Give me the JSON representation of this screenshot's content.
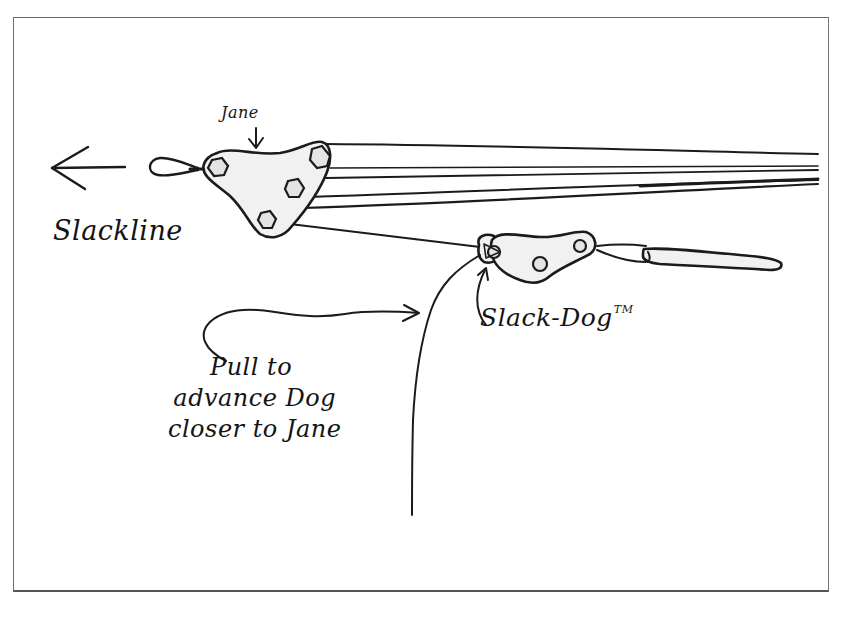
{
  "diagram": {
    "labels": {
      "jane": "Jane",
      "slackline": "Slackline",
      "slack_dog": "Slack-Dog",
      "trademark": "TM",
      "instruction_line1": "Pull to",
      "instruction_line2": "advance Dog",
      "instruction_line3": "closer to Jane"
    },
    "components": [
      {
        "id": "jane",
        "type": "triangular pulley plate",
        "holes": 4
      },
      {
        "id": "slack-dog",
        "type": "rope grab plate",
        "holes": 3
      },
      {
        "id": "anchor-pin",
        "type": "pin / stake"
      },
      {
        "id": "slackline-loop",
        "type": "webbing loop"
      }
    ],
    "arrows": [
      {
        "id": "tension-direction",
        "direction": "left"
      },
      {
        "id": "jane-pointer",
        "direction": "down",
        "target": "jane"
      },
      {
        "id": "dog-pointer",
        "direction": "up",
        "target": "slack-dog"
      },
      {
        "id": "pull-pointer",
        "direction": "right",
        "target": "pull-rope"
      }
    ],
    "colors": {
      "ink": "#1b1b1b",
      "plate_fill": "#f1f1f1",
      "frame": "#6d6d6d",
      "background": "#ffffff"
    }
  }
}
